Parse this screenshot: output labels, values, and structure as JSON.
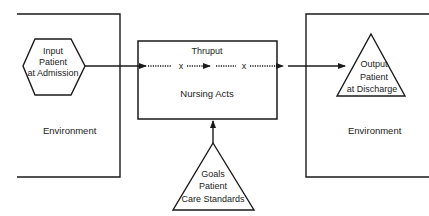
{
  "diagram": {
    "type": "systems-model",
    "input": {
      "shape": "hexagon",
      "lines": [
        "Input",
        "Patient",
        "at Admission"
      ]
    },
    "left_environment": {
      "label": "Environment"
    },
    "thruput": {
      "title": "Thruput",
      "label": "Nursing Acts",
      "markers": [
        "x",
        "x"
      ]
    },
    "output": {
      "shape": "triangle",
      "lines": [
        "Output",
        "Patient",
        "at Discharge"
      ]
    },
    "right_environment": {
      "label": "Environment"
    },
    "goals": {
      "shape": "triangle",
      "lines": [
        "Goals",
        "Patient",
        "Care Standards"
      ]
    },
    "colors": {
      "stroke": "#1a1a1a",
      "text": "#222222",
      "background": "#ffffff"
    },
    "edges": [
      {
        "from": "input",
        "to": "thruput"
      },
      {
        "from": "thruput",
        "to": "output"
      },
      {
        "from": "goals",
        "to": "thruput"
      }
    ]
  }
}
